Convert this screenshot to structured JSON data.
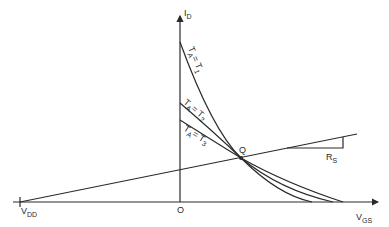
{
  "diagram": {
    "type": "JFET self-bias transfer characteristics with load line",
    "axes": {
      "y_label": "I",
      "y_label_sub": "D",
      "x_label": "V",
      "x_label_sub": "GS",
      "origin_label": "O",
      "vdd_label": "V",
      "vdd_label_sub": "DD"
    },
    "curves": [
      {
        "id": "T1",
        "label_main": "T",
        "label_sub_a": "A",
        "label_eq": "= T",
        "label_sub_b": "1"
      },
      {
        "id": "T2",
        "label_main": "T",
        "label_sub_a": "A",
        "label_eq": "= T",
        "label_sub_b": "2"
      },
      {
        "id": "T3",
        "label_main": "T",
        "label_sub_a": "A",
        "label_eq": "= T",
        "label_sub_b": "3"
      }
    ],
    "operating_point": {
      "label": "Q"
    },
    "load_line": {
      "slope_label": "R",
      "slope_label_sub": "S"
    },
    "colors": {
      "ink": "#2a2a2a",
      "background": "#ffffff"
    }
  }
}
